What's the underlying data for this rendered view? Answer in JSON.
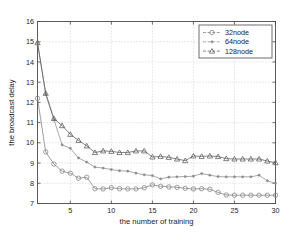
{
  "chart_data": {
    "type": "line",
    "title": "",
    "xlabel": "the number of training",
    "ylabel": "the broadcast delay",
    "xlim": [
      1,
      30
    ],
    "ylim": [
      7,
      16
    ],
    "xticks": [
      5,
      10,
      15,
      20,
      25,
      30
    ],
    "yticks": [
      7,
      8,
      9,
      10,
      11,
      12,
      13,
      14,
      15,
      16
    ],
    "grid": true,
    "legend_position": "top-right",
    "x": [
      1,
      2,
      3,
      4,
      5,
      6,
      7,
      8,
      9,
      10,
      11,
      12,
      13,
      14,
      15,
      16,
      17,
      18,
      19,
      20,
      21,
      22,
      23,
      24,
      25,
      26,
      27,
      28,
      29,
      30
    ],
    "series": [
      {
        "name": "32node",
        "marker": "circle",
        "color": "#808080",
        "values": [
          12.2,
          9.55,
          8.95,
          8.6,
          8.5,
          8.25,
          8.3,
          7.73,
          7.72,
          7.78,
          7.73,
          7.72,
          7.72,
          7.78,
          7.92,
          7.85,
          7.82,
          7.8,
          7.75,
          7.72,
          7.73,
          7.7,
          7.55,
          7.42,
          7.41,
          7.41,
          7.41,
          7.41,
          7.41,
          7.41
        ]
      },
      {
        "name": "64node",
        "marker": "dot",
        "color": "#8c8c8c",
        "values": [
          14.95,
          12.4,
          11.15,
          9.9,
          9.73,
          9.25,
          9.05,
          8.8,
          8.75,
          8.68,
          8.62,
          8.6,
          8.5,
          8.42,
          8.38,
          8.22,
          8.3,
          8.32,
          8.33,
          8.35,
          8.48,
          8.4,
          8.33,
          8.32,
          8.32,
          8.32,
          8.32,
          8.4,
          8.12,
          8.0
        ]
      },
      {
        "name": "128node",
        "marker": "triangle",
        "color": "#5a5a5a",
        "values": [
          14.95,
          12.45,
          11.2,
          10.85,
          10.42,
          10.12,
          9.85,
          9.52,
          9.6,
          9.58,
          9.52,
          9.52,
          9.6,
          9.6,
          9.3,
          9.33,
          9.28,
          9.2,
          9.12,
          9.35,
          9.33,
          9.35,
          9.32,
          9.22,
          9.2,
          9.2,
          9.2,
          9.2,
          9.1,
          9.02
        ]
      }
    ]
  }
}
